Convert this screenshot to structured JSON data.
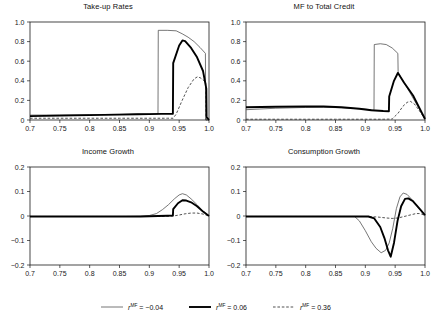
{
  "figure": {
    "width": 432,
    "height": 324,
    "background": "#ffffff"
  },
  "legend": {
    "position": "bottom-center",
    "items": [
      {
        "style": "thin-solid",
        "color": "#4a4a4a",
        "symbol": "r",
        "superscript": "MF",
        "equals": " = ",
        "value": "−0.04",
        "full_label": "r^MF = −0.04"
      },
      {
        "style": "thick-solid",
        "color": "#000000",
        "symbol": "r",
        "superscript": "MF",
        "equals": " = ",
        "value": "0.06",
        "full_label": "r^MF = 0.06"
      },
      {
        "style": "dashed",
        "color": "#333333",
        "symbol": "r",
        "superscript": "MF",
        "equals": " = ",
        "value": "0.36",
        "full_label": "r^MF = 0.36"
      }
    ]
  },
  "chart_data": [
    {
      "type": "line",
      "panel": "top-left",
      "title": "Take-up Rates",
      "xlabel": "",
      "ylabel": "",
      "xlim": [
        0.7,
        1.0
      ],
      "ylim": [
        0.0,
        1.0
      ],
      "grid": false,
      "xticks": [
        0.7,
        0.75,
        0.8,
        0.85,
        0.9,
        0.95,
        1.0
      ],
      "xticklabels": [
        "0.7",
        "0.75",
        "0.8",
        "0.85",
        "0.9",
        "0.95",
        "1.0"
      ],
      "yticks": [
        0.0,
        0.2,
        0.4,
        0.6,
        0.8,
        1.0
      ],
      "yticklabels": [
        "0",
        "0.2",
        "0.4",
        "0.6",
        "0.8",
        "1.0"
      ],
      "series": [
        {
          "name": "r^MF = -0.04",
          "style": "thin-solid",
          "x": [
            0.7,
            0.75,
            0.8,
            0.85,
            0.88,
            0.9,
            0.91,
            0.9145,
            0.915,
            0.93,
            0.945,
            0.955,
            0.965,
            0.975,
            0.985,
            0.994,
            0.9945,
            1.0
          ],
          "y": [
            0.05,
            0.052,
            0.055,
            0.058,
            0.06,
            0.062,
            0.063,
            0.064,
            0.915,
            0.915,
            0.91,
            0.88,
            0.845,
            0.8,
            0.74,
            0.68,
            0.0,
            0.0
          ]
        },
        {
          "name": "r^MF = 0.06",
          "style": "thick-solid",
          "x": [
            0.7,
            0.75,
            0.8,
            0.85,
            0.88,
            0.9,
            0.92,
            0.935,
            0.9395,
            0.94,
            0.95,
            0.9555,
            0.96,
            0.97,
            0.98,
            0.99,
            0.9955,
            0.996,
            1.0
          ],
          "y": [
            0.04,
            0.045,
            0.05,
            0.055,
            0.058,
            0.06,
            0.062,
            0.063,
            0.064,
            0.58,
            0.76,
            0.812,
            0.805,
            0.735,
            0.64,
            0.5,
            0.32,
            0.03,
            0.0
          ]
        },
        {
          "name": "r^MF = 0.36",
          "style": "dashed",
          "x": [
            0.7,
            0.75,
            0.8,
            0.85,
            0.9,
            0.93,
            0.94,
            0.945,
            0.955,
            0.965,
            0.975,
            0.9805,
            0.985,
            0.99,
            0.9945,
            0.995,
            1.0
          ],
          "y": [
            0.018,
            0.018,
            0.018,
            0.018,
            0.018,
            0.018,
            0.018,
            0.06,
            0.2,
            0.33,
            0.42,
            0.44,
            0.432,
            0.41,
            0.385,
            0.0,
            0.0
          ]
        }
      ]
    },
    {
      "type": "line",
      "panel": "top-right",
      "title": "MF to Total Credit",
      "xlabel": "",
      "ylabel": "",
      "xlim": [
        0.7,
        1.0
      ],
      "ylim": [
        0.0,
        1.0
      ],
      "grid": false,
      "xticks": [
        0.7,
        0.75,
        0.8,
        0.85,
        0.9,
        0.95,
        1.0
      ],
      "xticklabels": [
        "0.7",
        "0.75",
        "0.8",
        "0.85",
        "0.9",
        "0.95",
        "1.0"
      ],
      "yticks": [
        0.0,
        0.2,
        0.4,
        0.6,
        0.8,
        1.0
      ],
      "yticklabels": [
        "0",
        "0.2",
        "0.4",
        "0.6",
        "0.8",
        "1.0"
      ],
      "series": [
        {
          "name": "r^MF = -0.04",
          "style": "thin-solid",
          "x": [
            0.7,
            0.75,
            0.8,
            0.83,
            0.86,
            0.89,
            0.905,
            0.9145,
            0.915,
            0.925,
            0.935,
            0.945,
            0.9545,
            0.955,
            0.97,
            0.985,
            1.0
          ],
          "y": [
            0.105,
            0.12,
            0.128,
            0.13,
            0.125,
            0.115,
            0.108,
            0.1,
            0.77,
            0.778,
            0.77,
            0.735,
            0.68,
            0.48,
            0.33,
            0.17,
            0.01
          ]
        },
        {
          "name": "r^MF = 0.06",
          "style": "thick-solid",
          "x": [
            0.7,
            0.75,
            0.8,
            0.83,
            0.86,
            0.89,
            0.91,
            0.93,
            0.9395,
            0.94,
            0.948,
            0.9545,
            0.955,
            0.965,
            0.98,
            0.995,
            1.0
          ],
          "y": [
            0.13,
            0.135,
            0.138,
            0.138,
            0.13,
            0.115,
            0.1,
            0.092,
            0.09,
            0.24,
            0.4,
            0.48,
            0.478,
            0.38,
            0.25,
            0.07,
            0.01
          ]
        },
        {
          "name": "r^MF = 0.36",
          "style": "dashed",
          "x": [
            0.7,
            0.75,
            0.8,
            0.85,
            0.9,
            0.93,
            0.945,
            0.955,
            0.963,
            0.97,
            0.9755,
            0.982,
            0.99,
            1.0
          ],
          "y": [
            0.008,
            0.008,
            0.008,
            0.008,
            0.008,
            0.008,
            0.01,
            0.07,
            0.14,
            0.18,
            0.19,
            0.165,
            0.1,
            0.008
          ]
        }
      ]
    },
    {
      "type": "line",
      "panel": "bottom-left",
      "title": "Income Growth",
      "xlabel": "",
      "ylabel": "",
      "xlim": [
        0.7,
        1.0
      ],
      "ylim": [
        -0.2,
        0.2
      ],
      "grid": false,
      "xticks": [
        0.7,
        0.75,
        0.8,
        0.85,
        0.9,
        0.95,
        1.0
      ],
      "xticklabels": [
        "0.7",
        "0.75",
        "0.8",
        "0.85",
        "0.9",
        "0.95",
        "1.0"
      ],
      "yticks": [
        -0.2,
        -0.1,
        0.0,
        0.1,
        0.2
      ],
      "yticklabels": [
        "−0.2",
        "−0.1",
        "0",
        "0.1",
        "0.2"
      ],
      "series": [
        {
          "name": "r^MF = -0.04",
          "style": "thin-solid",
          "x": [
            0.7,
            0.8,
            0.86,
            0.885,
            0.9,
            0.912,
            0.922,
            0.932,
            0.942,
            0.95,
            0.9555,
            0.962,
            0.97,
            0.98,
            0.99,
            1.0
          ],
          "y": [
            -0.002,
            -0.002,
            -0.002,
            -0.001,
            0.002,
            0.01,
            0.026,
            0.046,
            0.07,
            0.086,
            0.091,
            0.086,
            0.07,
            0.046,
            0.02,
            0.0
          ]
        },
        {
          "name": "r^MF = 0.06",
          "style": "thick-solid",
          "x": [
            0.7,
            0.8,
            0.86,
            0.885,
            0.9,
            0.915,
            0.93,
            0.9395,
            0.94,
            0.948,
            0.9555,
            0.962,
            0.97,
            0.98,
            0.99,
            1.0
          ],
          "y": [
            -0.002,
            -0.002,
            -0.002,
            -0.002,
            -0.001,
            0.0,
            0.001,
            0.002,
            0.028,
            0.052,
            0.064,
            0.063,
            0.056,
            0.04,
            0.018,
            0.0
          ]
        },
        {
          "name": "r^MF = 0.36",
          "style": "dashed",
          "x": [
            0.7,
            0.8,
            0.87,
            0.9,
            0.92,
            0.94,
            0.95,
            0.96,
            0.97,
            0.98,
            0.99,
            1.0
          ],
          "y": [
            -0.002,
            -0.002,
            -0.002,
            -0.002,
            -0.002,
            0.0,
            0.004,
            0.009,
            0.012,
            0.012,
            0.008,
            0.0
          ]
        }
      ]
    },
    {
      "type": "line",
      "panel": "bottom-right",
      "title": "Consumption Growth",
      "xlabel": "",
      "ylabel": "",
      "xlim": [
        0.7,
        1.0
      ],
      "ylim": [
        -0.2,
        0.2
      ],
      "grid": false,
      "xticks": [
        0.7,
        0.75,
        0.8,
        0.85,
        0.9,
        0.95,
        1.0
      ],
      "xticklabels": [
        "0.7",
        "0.75",
        "0.8",
        "0.85",
        "0.9",
        "0.95",
        "1.0"
      ],
      "yticks": [
        -0.2,
        -0.1,
        0.0,
        0.1,
        0.2
      ],
      "yticklabels": [
        "−0.2",
        "−0.1",
        "0",
        "0.1",
        "0.2"
      ],
      "series": [
        {
          "name": "r^MF = -0.04",
          "style": "thin-solid",
          "x": [
            0.7,
            0.8,
            0.86,
            0.882,
            0.89,
            0.9,
            0.91,
            0.918,
            0.9265,
            0.934,
            0.94,
            0.946,
            0.952,
            0.958,
            0.9635,
            0.97,
            0.98,
            0.99,
            1.0
          ],
          "y": [
            -0.002,
            -0.002,
            -0.002,
            -0.002,
            -0.02,
            -0.06,
            -0.105,
            -0.132,
            -0.15,
            -0.14,
            -0.11,
            -0.05,
            0.03,
            0.078,
            0.094,
            0.088,
            0.062,
            0.03,
            0.002
          ]
        },
        {
          "name": "r^MF = 0.06",
          "style": "thick-solid",
          "x": [
            0.7,
            0.8,
            0.86,
            0.89,
            0.905,
            0.915,
            0.925,
            0.932,
            0.938,
            0.9425,
            0.948,
            0.954,
            0.96,
            0.9665,
            0.972,
            0.98,
            0.99,
            1.0
          ],
          "y": [
            -0.002,
            -0.002,
            -0.002,
            -0.002,
            -0.002,
            -0.01,
            -0.045,
            -0.09,
            -0.14,
            -0.166,
            -0.11,
            -0.02,
            0.04,
            0.07,
            0.072,
            0.06,
            0.032,
            0.004
          ]
        },
        {
          "name": "r^MF = 0.36",
          "style": "dashed",
          "x": [
            0.7,
            0.8,
            0.87,
            0.9,
            0.92,
            0.935,
            0.945,
            0.955,
            0.965,
            0.975,
            0.985,
            0.992,
            1.0
          ],
          "y": [
            -0.002,
            -0.002,
            -0.002,
            -0.002,
            -0.004,
            -0.008,
            -0.01,
            -0.008,
            -0.002,
            0.004,
            0.01,
            0.01,
            0.002
          ]
        }
      ]
    }
  ]
}
